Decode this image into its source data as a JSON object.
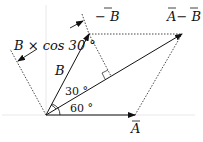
{
  "diagram": {
    "type": "vector-subtraction",
    "labels": {
      "vec_A": "A",
      "vec_B": "B",
      "neg_B": "− B",
      "A_minus_B": "A− B",
      "B_mag": "B",
      "projection": "B × cos 30 °",
      "angle_30": "30 °",
      "angle_60": "60 °"
    },
    "colors": {
      "line": "#222222",
      "guide": "#e6e6e6"
    }
  }
}
